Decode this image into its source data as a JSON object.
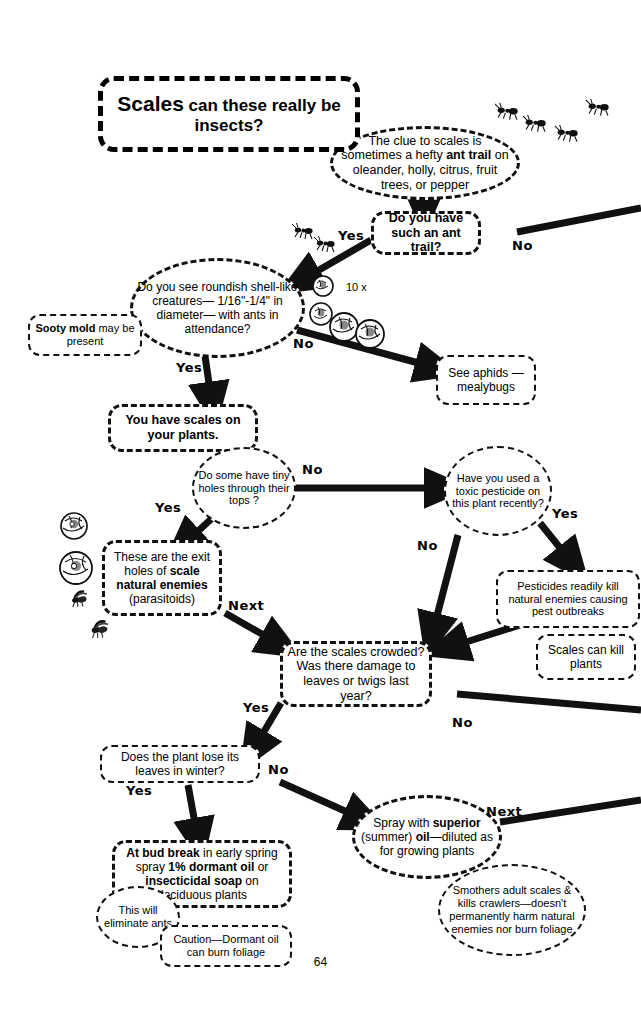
{
  "page": {
    "title_lead": "Scales",
    "title_rest": "can these really be insects?",
    "page_number": "64",
    "magnification_label": "10 x"
  },
  "nodes": {
    "clue": "The clue to scales is sometimes a hefty ant trail on oleander, holly, citrus, fruit trees, or pepper",
    "ant_trail_q": "Do you have such an ant trail?",
    "roundish_q": "Do you see roundish shell-like creatures— 1/16\"-1/4\" in diameter— with ants in attendance?",
    "sooty_mold": "Sooty mold may be present",
    "see_aphids": "See aphids — mealybugs",
    "you_have_scales": "You have scales on your plants.",
    "tiny_holes_q": "Do some have tiny holes through their tops ?",
    "toxic_pesticide_q": "Have you used a toxic pesticide on this plant recently?",
    "exit_holes": "These are the exit holes of scale natural enemies (parasitoids)",
    "pesticides_kill": "Pesticides readily kill natural enemies causing pest outbreaks",
    "scales_kill": "Scales can kill plants",
    "crowded_q": "Are the scales crowded?  Was there damage to leaves or twigs last year?",
    "lose_leaves_q": "Does the plant lose its leaves in winter?",
    "bud_break": "At bud break in early spring spray 1% dormant oil or insecticidal soap on deciduous plants",
    "eliminate_ants": "This will eliminate ants",
    "caution_dormant": "Caution—Dormant oil can burn foliage",
    "spray_superior": "Spray with superior (summer) oil—diluted as for growing plants",
    "smothers": "Smothers adult scales & kills crawlers—doesn't permanently harm natural enemies nor burn foliage"
  },
  "edge_labels": {
    "yes_ant_trail": "Yes",
    "no_ant_trail": "No",
    "no_roundish": "No",
    "yes_roundish": "Yes",
    "no_tiny_holes": "No",
    "yes_tiny_holes": "Yes",
    "yes_pesticide": "Yes",
    "no_pesticide": "No",
    "next_exit_holes": "Next",
    "yes_crowded": "Yes",
    "no_crowded": "No",
    "yes_lose_leaves": "Yes",
    "no_lose_leaves": "No",
    "next_spray": "Next"
  },
  "colors": {
    "ink": "#000000",
    "paper": "#ffffff"
  }
}
